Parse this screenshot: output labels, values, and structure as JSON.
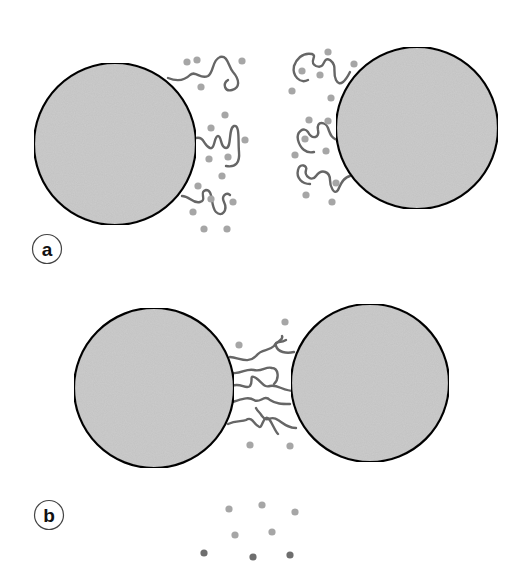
{
  "figure": {
    "colors": {
      "background": "#ffffff",
      "particle_fill": "#cccccc",
      "particle_stroke": "#111111",
      "polymer_chain": "#666666",
      "solvent_dot_light": "#a6a6a6",
      "solvent_dot_dark": "#6e6e6e",
      "label_ring": "#444444"
    },
    "panels": [
      {
        "id": "a",
        "label": "a",
        "description": "Two separated colloidal particles with grafted polymer chains extended into solvent (steric stabilization)",
        "label_circle": {
          "cx": 47,
          "cy": 249,
          "r": 15
        },
        "particles": [
          {
            "cx": 115,
            "cy": 144,
            "r": 81
          },
          {
            "cx": 417,
            "cy": 128,
            "r": 81
          }
        ]
      },
      {
        "id": "b",
        "label": "b",
        "description": "Two particles brought together; chains interpenetrate and solvent is expelled from the overlap region",
        "label_circle": {
          "cx": 49,
          "cy": 515,
          "r": 15
        },
        "particles": [
          {
            "cx": 154,
            "cy": 388,
            "r": 80
          },
          {
            "cx": 370,
            "cy": 383,
            "r": 79
          }
        ]
      }
    ]
  }
}
